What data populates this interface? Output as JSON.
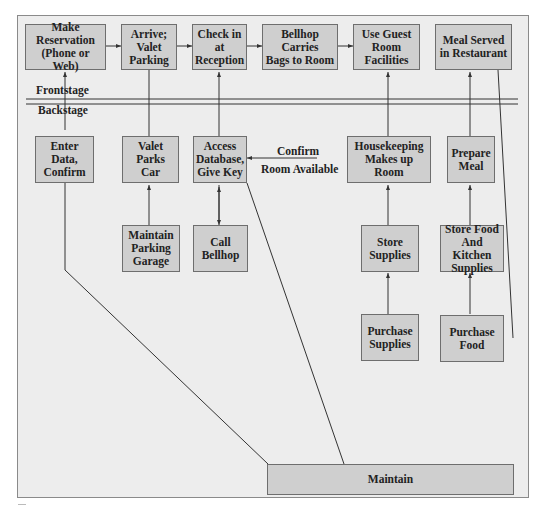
{
  "diagram": {
    "type": "service-blueprint",
    "colors": {
      "background": "#ededed",
      "box_fill": "#cfcfcf",
      "box_border": "#6e6e6e",
      "line": "#333333"
    },
    "zones": {
      "frontstage_label": "Frontstage",
      "backstage_label": "Backstage"
    },
    "frontstage": [
      {
        "id": "make-reservation",
        "label": "Make\nReservation\n(Phone or Web)"
      },
      {
        "id": "arrive-valet",
        "label": "Arrive;\nValet\nParking"
      },
      {
        "id": "check-in",
        "label": "Check in\nat\nReception"
      },
      {
        "id": "bellhop-carries",
        "label": "Bellhop\nCarries\nBags to Room"
      },
      {
        "id": "use-guest-room",
        "label": "Use Guest\nRoom\nFacilities"
      },
      {
        "id": "meal-served",
        "label": "Meal Served\nin Restaurant"
      }
    ],
    "backstage": [
      {
        "id": "enter-data",
        "label": "Enter Data,\nConfirm"
      },
      {
        "id": "valet-parks",
        "label": "Valet\nParks\nCar"
      },
      {
        "id": "access-database",
        "label": "Access\nDatabase,\nGive Key"
      },
      {
        "id": "housekeeping",
        "label": "Housekeeping\nMakes up Room"
      },
      {
        "id": "prepare-meal",
        "label": "Prepare\nMeal"
      },
      {
        "id": "maintain-parking",
        "label": "Maintain\nParking\nGarage"
      },
      {
        "id": "call-bellhop",
        "label": "Call\nBellhop"
      },
      {
        "id": "store-supplies",
        "label": "Store\nSupplies"
      },
      {
        "id": "store-food",
        "label": "Store Food\nAnd Kitchen\nSupplies"
      },
      {
        "id": "purchase-supplies",
        "label": "Purchase\nSupplies"
      },
      {
        "id": "purchase-food",
        "label": "Purchase\nFood"
      },
      {
        "id": "maintain",
        "label": "Maintain"
      }
    ],
    "edge_labels": {
      "confirm": "Confirm",
      "room_available": "Room Available"
    }
  }
}
